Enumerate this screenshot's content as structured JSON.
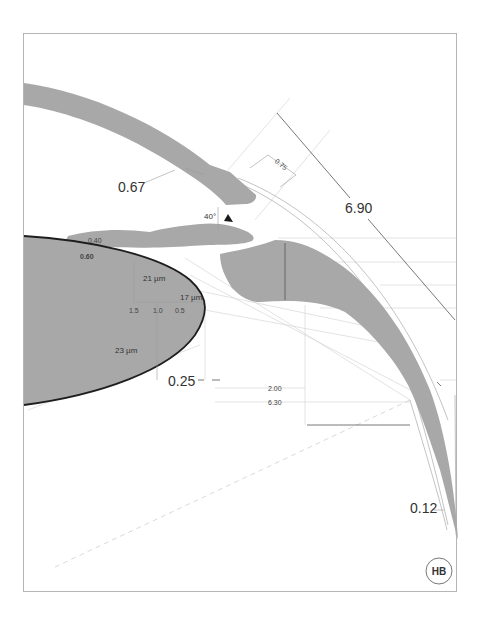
{
  "diagram": {
    "colors": {
      "frame": "#b5b5b5",
      "tissue_fill": "#a8a8a8",
      "lens_outline": "#1e1e1e",
      "dimension_line": "#555555",
      "construction_line": "#cfcfcf",
      "text": "#333333"
    },
    "structures": [
      {
        "id": "cornea-sclera",
        "label": "Cornea / sclera band (gray)"
      },
      {
        "id": "iris",
        "label": "Iris (gray)"
      },
      {
        "id": "ciliary-body",
        "label": "Ciliary body (gray)"
      },
      {
        "id": "lens",
        "label": "Crystalline lens (gray, dark outline)"
      }
    ],
    "annotations": {
      "cornea_thickness": "0.67",
      "angle_depth": "0.75",
      "chord_length": "6.90",
      "angle": "40°",
      "iris_thickness_top": "0.40",
      "iris_lens_gap": "0.60",
      "lens_thickness_21": "21 µm",
      "lens_thickness_17": "17 µm",
      "lens_thickness_23": "23 µm",
      "lens_scale": [
        "1.5",
        "1.0",
        "0.5"
      ],
      "gap_025": "0.25",
      "dim_200": "2.00",
      "dim_630": "6.30",
      "sclera_thickness": "0.12"
    },
    "signature": "HB"
  }
}
